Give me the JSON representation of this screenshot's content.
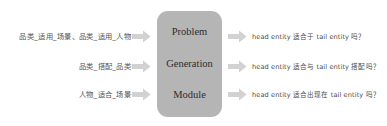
{
  "figure": {
    "type": "flow-diagram",
    "background_color": "#ffffff",
    "module_color": "#b5b5b5",
    "arrow_color": "#d0d0d0",
    "text_color": "#4a4a4a"
  },
  "inputs": {
    "items": [
      {
        "text": "品类_适用_场景、品类_适用_人物"
      },
      {
        "text": "品类_搭配_品类"
      },
      {
        "text": "人物_适合_场景"
      }
    ]
  },
  "module": {
    "lines": [
      {
        "text": "Problem"
      },
      {
        "text": "Generation"
      },
      {
        "text": "Module"
      }
    ]
  },
  "outputs": {
    "items": [
      {
        "text": "head entity 适合于 tail entity 吗？"
      },
      {
        "text": "head entity 适合与 tail entity 搭配吗？"
      },
      {
        "text": "head entity 适合出现在 tail entity 吗？"
      }
    ]
  },
  "arrows": {
    "inbound": [
      {
        "name": "arrow-input-1"
      },
      {
        "name": "arrow-input-2"
      },
      {
        "name": "arrow-input-3"
      }
    ],
    "outbound": [
      {
        "name": "arrow-output-1"
      },
      {
        "name": "arrow-output-2"
      },
      {
        "name": "arrow-output-3"
      }
    ]
  }
}
